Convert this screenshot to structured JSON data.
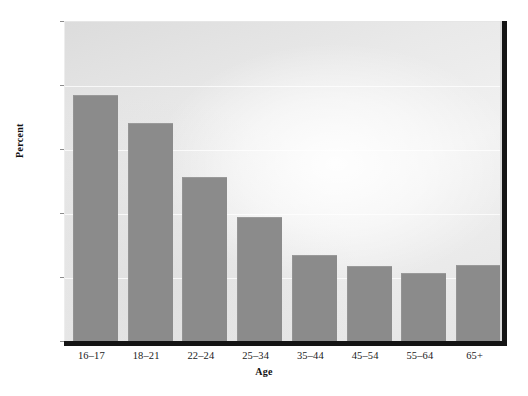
{
  "chart_data": {
    "type": "bar",
    "title": "",
    "xlabel": "Age",
    "ylabel": "Percent",
    "categories": [
      "16–17",
      "18–21",
      "22–24",
      "25–34",
      "35–44",
      "45–54",
      "55–64",
      "65+"
    ],
    "values": [
      0.0775,
      0.0688,
      0.0519,
      0.0394,
      0.0275,
      0.0241,
      0.0219,
      0.0244
    ],
    "ylim": [
      0.0,
      0.1
    ],
    "ytick_values": [
      0.0,
      0.02,
      0.04,
      0.06,
      0.08,
      0.1
    ],
    "ytick_labels": [
      "0.00",
      "0.02",
      "0.04",
      "0.06",
      "0.08",
      "0.10"
    ],
    "grid": true,
    "grid_axis": "y",
    "legend": false,
    "legend_position": "none",
    "bar_color": "#8b8b8b",
    "plot_background": "#e6e6e6",
    "axis_color": "#141414",
    "figure_background": "#ffffff"
  }
}
